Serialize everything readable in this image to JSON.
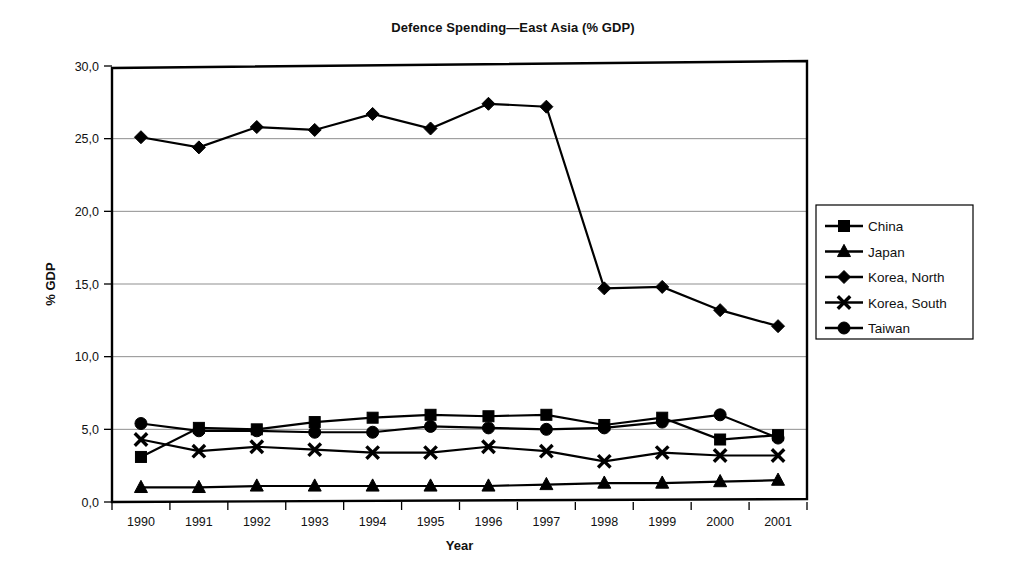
{
  "chart_data": {
    "type": "line",
    "title": "Defence Spending—East Asia (% GDP)",
    "xlabel": "Year",
    "ylabel": "% GDP",
    "categories": [
      "1990",
      "1991",
      "1992",
      "1993",
      "1994",
      "1995",
      "1996",
      "1997",
      "1998",
      "1999",
      "2000",
      "2001"
    ],
    "ylim": [
      0,
      30
    ],
    "yticks": [
      "0,0",
      "5,0",
      "10,0",
      "15,0",
      "20,0",
      "25,0",
      "30,0"
    ],
    "ytick_values": [
      0,
      5,
      10,
      15,
      20,
      25,
      30
    ],
    "grid": "horizontal",
    "legend_position": "right-outside",
    "series": [
      {
        "name": "China",
        "marker": "square",
        "values": [
          3.1,
          5.1,
          5.0,
          5.5,
          5.8,
          6.0,
          5.9,
          6.0,
          5.3,
          5.8,
          4.3,
          4.6
        ]
      },
      {
        "name": "Japan",
        "marker": "triangle",
        "values": [
          1.0,
          1.0,
          1.1,
          1.1,
          1.1,
          1.1,
          1.1,
          1.2,
          1.3,
          1.3,
          1.4,
          1.5
        ]
      },
      {
        "name": "Korea, North",
        "marker": "diamond",
        "values": [
          25.1,
          24.4,
          25.8,
          25.6,
          26.7,
          25.7,
          27.4,
          27.2,
          14.7,
          14.8,
          13.2,
          12.1
        ]
      },
      {
        "name": "Korea, South",
        "marker": "x",
        "values": [
          4.3,
          3.5,
          3.8,
          3.6,
          3.4,
          3.4,
          3.8,
          3.5,
          2.8,
          3.4,
          3.2,
          3.2
        ]
      },
      {
        "name": "Taiwan",
        "marker": "circle",
        "values": [
          5.4,
          4.9,
          4.9,
          4.8,
          4.8,
          5.2,
          5.1,
          5.0,
          5.1,
          5.5,
          6.0,
          4.4
        ]
      }
    ],
    "legend_entries": [
      "China",
      "Japan",
      "Korea, North",
      "Korea, South",
      "Taiwan"
    ],
    "colors": {
      "ink": "#000000",
      "grid": "#8f8f8f",
      "background": "#ffffff"
    }
  }
}
